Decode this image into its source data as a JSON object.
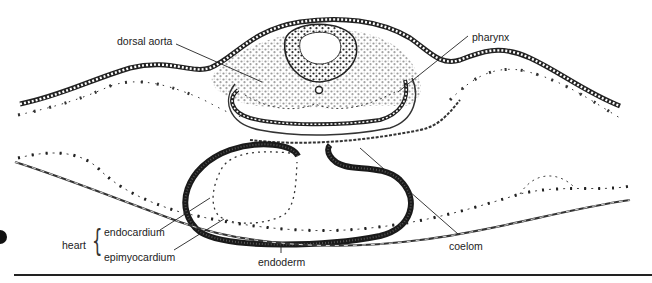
{
  "figure": {
    "type": "embryo-cross-section-illustration",
    "labels": {
      "dorsal_aorta": "dorsal aorta",
      "pharynx": "pharynx",
      "heart": "heart",
      "endocardium": "endocardium",
      "epimyocardium": "epimyocardium",
      "endoderm": "endoderm",
      "coelom": "coelom"
    },
    "colors": {
      "ink": "#1a1a1a",
      "background": "#ffffff"
    }
  }
}
